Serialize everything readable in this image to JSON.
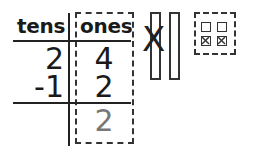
{
  "place_value_chart": {
    "headers": {
      "tens": "tens",
      "ones": "ones"
    },
    "rows": [
      {
        "tens": "2",
        "ones": "4"
      },
      {
        "tens": "-1",
        "ones": "2"
      }
    ],
    "result": {
      "tens": "",
      "ones": "2"
    },
    "answer_color": "#777777"
  },
  "base_ten_model": {
    "tens_rods": [
      {
        "crossed_out": true
      },
      {
        "crossed_out": false
      }
    ],
    "unit_cubes": [
      {
        "crossed_out": false
      },
      {
        "crossed_out": false
      },
      {
        "crossed_out": true
      },
      {
        "crossed_out": true
      }
    ],
    "cross_mark": "X"
  }
}
